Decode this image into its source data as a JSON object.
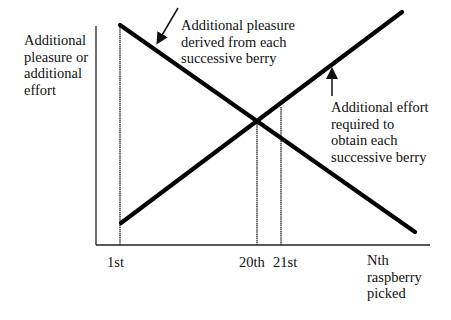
{
  "diagram": {
    "type": "economics-marginal-analysis",
    "y_axis_label": [
      "Additional",
      "pleasure or",
      "additional",
      "effort"
    ],
    "x_axis_label": [
      "Nth",
      "raspberry",
      "picked"
    ],
    "x_ticks": [
      {
        "label": "1st",
        "x": 120
      },
      {
        "label": "20th",
        "x": 257
      },
      {
        "label": "21st",
        "x": 281
      }
    ],
    "curves": [
      {
        "name": "marginal-benefit",
        "label": [
          "Additional pleasure",
          "derived from each",
          "successive berry"
        ],
        "trend": "decreasing",
        "from": [
          120,
          25
        ],
        "to": [
          415,
          232
        ]
      },
      {
        "name": "marginal-cost",
        "label": [
          "Additional effort",
          "required to",
          "obtain each",
          "successive berry"
        ],
        "trend": "increasing",
        "from": [
          121,
          223
        ],
        "to": [
          402,
          12
        ]
      }
    ],
    "intersection": {
      "x_label": "20th",
      "point": [
        257,
        120
      ]
    },
    "colors": {
      "line": "#000000",
      "background": "#ffffff"
    }
  }
}
